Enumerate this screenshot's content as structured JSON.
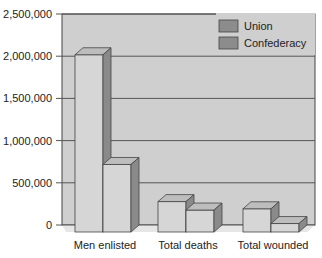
{
  "chart_data": {
    "type": "bar",
    "style": "3d-clustered-column",
    "title": "",
    "xlabel": "",
    "ylabel": "",
    "categories": [
      "Men enlisted",
      "Total deaths",
      "Total wounded"
    ],
    "series": [
      {
        "name": "Union",
        "values": [
          2100000,
          360000,
          275000
        ]
      },
      {
        "name": "Confederacy",
        "values": [
          800000,
          260000,
          100000
        ]
      }
    ],
    "yticks": [
      0,
      500000,
      1000000,
      1500000,
      2000000,
      2500000
    ],
    "ytick_labels": [
      "0",
      "500,000",
      "1,000,000",
      "1,500,000",
      "2,000,000",
      "2,500,000"
    ],
    "ylim": [
      0,
      2500000
    ],
    "grid": true,
    "legend_position": "top-right-inside"
  },
  "colors": {
    "plot_wall": "#cfcfcf",
    "bar_front": "#d6d6d6",
    "bar_top": "#bdbdbd",
    "bar_side": "#8a8a8a",
    "legend_swatch": "#8c8c8c",
    "grid": "#555555",
    "outline": "#444444"
  }
}
